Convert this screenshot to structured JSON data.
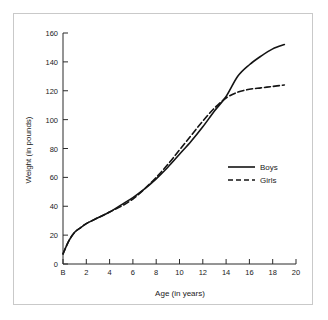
{
  "chart_data": {
    "type": "line",
    "title": "",
    "xlabel": "Age (in years)",
    "ylabel": "Weight (in pounds)",
    "xlim": [
      0,
      20
    ],
    "ylim": [
      0,
      160
    ],
    "grid": false,
    "legend_position": "center-right",
    "x_tick_labels": [
      "B",
      "2",
      "4",
      "6",
      "8",
      "10",
      "12",
      "14",
      "16",
      "18",
      "20"
    ],
    "x_tick_values": [
      0,
      2,
      4,
      6,
      8,
      10,
      12,
      14,
      16,
      18,
      20
    ],
    "y_tick_labels": [
      "0",
      "20",
      "40",
      "60",
      "80",
      "100",
      "120",
      "140",
      "160"
    ],
    "y_tick_values": [
      0,
      20,
      40,
      60,
      80,
      100,
      120,
      140,
      160
    ],
    "series": [
      {
        "name": "Boys",
        "style": "solid",
        "x": [
          0,
          0.5,
          1,
          1.5,
          2,
          3,
          4,
          5,
          6,
          7,
          8,
          9,
          10,
          11,
          12,
          13,
          14,
          15,
          16,
          17,
          18,
          19
        ],
        "values": [
          7,
          16,
          22,
          25,
          28,
          32,
          36,
          41,
          46,
          52,
          59,
          67,
          76,
          85,
          95,
          106,
          116,
          130,
          138,
          144,
          149,
          152
        ]
      },
      {
        "name": "Girls",
        "style": "dashed",
        "x": [
          0,
          0.5,
          1,
          1.5,
          2,
          3,
          4,
          5,
          6,
          7,
          8,
          9,
          10,
          11,
          12,
          13,
          14,
          15,
          16,
          17,
          18,
          19
        ],
        "values": [
          7,
          16,
          22,
          25,
          28,
          32,
          36,
          40,
          45,
          52,
          60,
          69,
          79,
          89,
          99,
          108,
          115,
          119,
          121,
          122,
          123,
          124
        ]
      }
    ]
  },
  "legend": {
    "entries": [
      {
        "label": "Boys"
      },
      {
        "label": "Girls"
      }
    ]
  }
}
